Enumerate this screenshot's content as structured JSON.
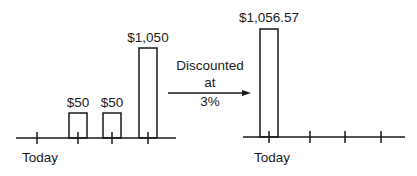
{
  "diagram": {
    "type": "cash-flow-timeline",
    "left_panel": {
      "axis_label": "Today",
      "cash_flows": [
        {
          "period": 1,
          "label": "$50",
          "value": 50
        },
        {
          "period": 2,
          "label": "$50",
          "value": 50
        },
        {
          "period": 3,
          "label": "$1,050",
          "value": 1050
        }
      ]
    },
    "arrow": {
      "line1": "Discounted",
      "line2": "at",
      "line3": "3%"
    },
    "right_panel": {
      "axis_label": "Today",
      "cash_flows": [
        {
          "period": 0,
          "label": "$1,056.57",
          "value": 1056.57
        }
      ]
    }
  },
  "colors": {
    "stroke": "#1a1a1a",
    "background": "#ffffff"
  }
}
